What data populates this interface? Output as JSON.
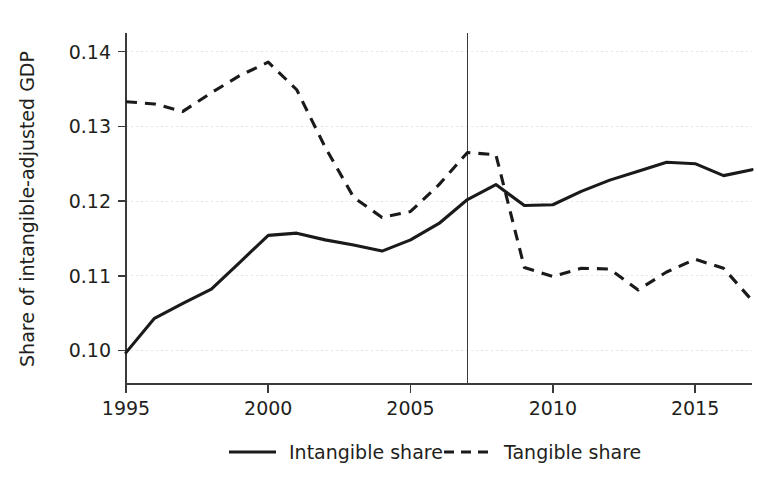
{
  "chart_data": {
    "type": "line",
    "title": "",
    "xlabel": "",
    "ylabel": "Share of intangible-adjusted GDP",
    "xlim": [
      1995,
      2017
    ],
    "ylim": [
      0.0955,
      0.1425
    ],
    "grid": true,
    "legend_position": "bottom",
    "x": [
      1995,
      1996,
      1997,
      1998,
      1999,
      2000,
      2001,
      2002,
      2003,
      2004,
      2005,
      2006,
      2007,
      2008,
      2009,
      2010,
      2011,
      2012,
      2013,
      2014,
      2015,
      2016,
      2017
    ],
    "xticks": [
      1995,
      2000,
      2005,
      2010,
      2015
    ],
    "xtick_labels": [
      "1995",
      "2000",
      "2005",
      "2010",
      "2015"
    ],
    "yticks": [
      0.1,
      0.11,
      0.12,
      0.13,
      0.14
    ],
    "ytick_labels": [
      "0.10",
      "0.11",
      "0.12",
      "0.13",
      "0.14"
    ],
    "series": [
      {
        "name": "Intangible share",
        "style": "solid",
        "color": "#1a1a1a",
        "values": [
          0.0997,
          0.1043,
          0.1063,
          0.1082,
          0.1118,
          0.1154,
          0.1157,
          0.1148,
          0.1141,
          0.1133,
          0.1148,
          0.117,
          0.1202,
          0.1222,
          0.1194,
          0.1195,
          0.1213,
          0.1228,
          0.124,
          0.1252,
          0.125,
          0.1234,
          0.1242
        ]
      },
      {
        "name": "Tangible share",
        "style": "dashed",
        "color": "#1a1a1a",
        "values": [
          0.1333,
          0.133,
          0.132,
          0.1345,
          0.1368,
          0.1386,
          0.1349,
          0.1272,
          0.1205,
          0.1178,
          0.1186,
          0.1222,
          0.1265,
          0.1262,
          0.1111,
          0.1099,
          0.111,
          0.1109,
          0.1081,
          0.1105,
          0.1122,
          0.111,
          0.1067
        ]
      }
    ],
    "reference_lines": [
      {
        "name": "year-2007-marker",
        "orientation": "vertical",
        "x": 2007
      }
    ],
    "legend": [
      {
        "label": "Intangible share",
        "style": "solid"
      },
      {
        "label": "Tangible share",
        "style": "dashed"
      }
    ]
  }
}
